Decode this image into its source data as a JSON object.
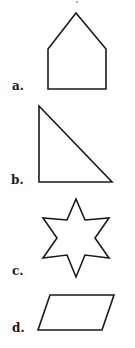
{
  "items": [
    {
      "label": "a.",
      "shape": "pentagon",
      "points": "76,13 106,49 106,89 48,89 48,49",
      "label_pos": {
        "left": 12,
        "top": 80
      }
    },
    {
      "label": "b.",
      "shape": "right-triangle",
      "points": "39,106 112,182 39,182",
      "label_pos": {
        "left": 11,
        "top": 174
      }
    },
    {
      "label": "c.",
      "shape": "six-pointed-star",
      "points": "76,199 85,220 109,218 95,238 109,258 85,255 76,277 67,255 43,258 57,238 43,218 67,220",
      "label_pos": {
        "left": 12,
        "top": 265
      }
    },
    {
      "label": "d.",
      "shape": "parallelogram",
      "points": "50,295 114,295 102,330 38,330",
      "label_pos": {
        "left": 12,
        "top": 322
      }
    }
  ],
  "colors": {
    "stroke": "#1a1a1a",
    "text": "#1a1a1a",
    "background": "#ffffff"
  }
}
